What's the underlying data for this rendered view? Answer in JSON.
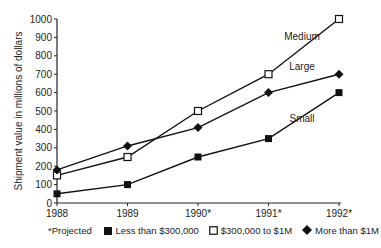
{
  "chart_data": {
    "type": "line",
    "title": "",
    "xlabel": "",
    "ylabel": "Shipment value in millions of dollars",
    "ylim": [
      0,
      1000
    ],
    "yticks": [
      0,
      100,
      200,
      300,
      400,
      500,
      600,
      700,
      800,
      900,
      1000
    ],
    "categories": [
      "1988",
      "1989",
      "1990*",
      "1991*",
      "1992*"
    ],
    "series": [
      {
        "name": "Small",
        "legend": "Less than $300,000",
        "marker": "filled-square",
        "values": [
          50,
          100,
          250,
          350,
          600
        ]
      },
      {
        "name": "Medium",
        "legend": "$300,000 to $1M",
        "marker": "open-square",
        "values": [
          150,
          250,
          500,
          700,
          1000
        ]
      },
      {
        "name": "Large",
        "legend": "More than $1M",
        "marker": "filled-diamond",
        "values": [
          180,
          310,
          410,
          600,
          700
        ]
      }
    ],
    "annotations": [
      {
        "text": "Medium",
        "x": "1991*",
        "y": 870
      },
      {
        "text": "Large",
        "x": "1991*",
        "y": 700
      },
      {
        "text": "Small",
        "x": "1991*",
        "y": 480
      }
    ],
    "footnote": "*Projected",
    "grid": false,
    "legend_position": "bottom"
  },
  "legend": {
    "footnote": "*Projected",
    "items": [
      {
        "label": "Less than $300,000",
        "marker": "filled-square"
      },
      {
        "label": "$300,000 to $1M",
        "marker": "open-square"
      },
      {
        "label": "More than $1M",
        "marker": "filled-diamond"
      }
    ]
  }
}
